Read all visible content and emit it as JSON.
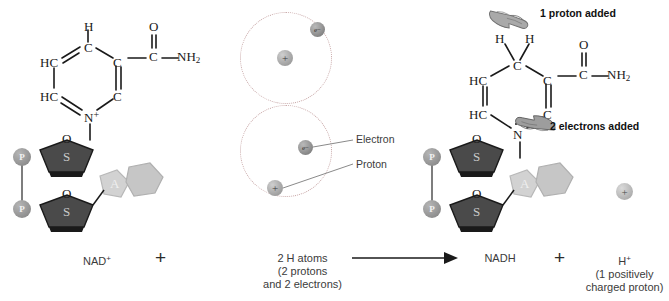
{
  "figure": {
    "topic": "Reduction of NAD+ to NADH",
    "reaction_arrow": "→"
  },
  "left": {
    "label": "NAD",
    "label_sup": "+",
    "plus_sign": "+",
    "ring": {
      "atom_top_h": "H",
      "atom_c_top": "C",
      "atom_hc_upper": "HC",
      "atom_hc_lower": "HC",
      "atom_c_right_upper": "C",
      "atom_c_right_lower": "C",
      "atom_n": "N",
      "n_charge": "+",
      "carbonyl_o": "O",
      "carbonyl_c": "C",
      "amide": "NH",
      "amide_sub": "2"
    },
    "backbone": {
      "phosphate_1": "P",
      "phosphate_2": "P",
      "sugar_o_1": "O",
      "sugar_s_1": "S",
      "sugar_o_2": "O",
      "sugar_s_2": "S",
      "adenine": "A"
    }
  },
  "middle": {
    "caption_line1": "2 H atoms",
    "caption_line2": "(2 protons",
    "caption_line3": "and 2 electrons)",
    "electron_label": "Electron",
    "proton_label": "Proton",
    "electron_glyph": "e−",
    "proton_glyph": "+",
    "atom_count": 2
  },
  "right": {
    "label": "NADH",
    "plus_sign": "+",
    "annotation_proton": "1 proton added",
    "annotation_electrons": "2 electrons added",
    "ring": {
      "atom_h_left": "H",
      "atom_h_right": "H",
      "atom_c_top": "C",
      "atom_hc_upper": "HC",
      "atom_hc_lower": "HC",
      "atom_c_right_upper": "C",
      "atom_c_right_lower": "C",
      "atom_n": "N",
      "carbonyl_o": "O",
      "carbonyl_c": "C",
      "amide": "NH",
      "amide_sub": "2"
    },
    "backbone": {
      "phosphate_1": "P",
      "phosphate_2": "P",
      "sugar_o_1": "O",
      "sugar_s_1": "S",
      "sugar_o_2": "O",
      "sugar_s_2": "S",
      "adenine": "A"
    }
  },
  "product_proton": {
    "glyph": "+",
    "label": "H",
    "label_sup": "+",
    "caption_line1": "(1 positively",
    "caption_line2": "charged proton)"
  },
  "colors": {
    "background": "#ffffff",
    "bond": "#1a1a1a",
    "sugar_fill": "#4a4a4a",
    "adenine_fill": "#cccccc",
    "phosphate_fill": "#9b9b9b",
    "orbit_stroke": "#c9a9a9",
    "text": "#3b3b3b"
  }
}
